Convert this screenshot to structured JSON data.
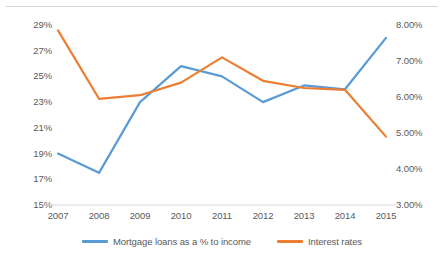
{
  "chart_data": {
    "type": "line",
    "title": "",
    "subtitle": "",
    "xlabel": "",
    "ylabel": "",
    "grid": false,
    "legend_position": "bottom",
    "categories": [
      "2007",
      "2008",
      "2009",
      "2010",
      "2011",
      "2012",
      "2013",
      "2014",
      "2015"
    ],
    "axes": {
      "x": {
        "tick_labels": [
          "2007",
          "2008",
          "2009",
          "2010",
          "2011",
          "2012",
          "2013",
          "2014",
          "2015"
        ]
      },
      "y_left": {
        "label": "",
        "ylim": [
          15,
          29
        ],
        "tick_values": [
          15,
          17,
          19,
          21,
          23,
          25,
          27,
          29
        ],
        "tick_labels": [
          "15%",
          "17%",
          "19%",
          "21%",
          "23%",
          "25%",
          "27%",
          "29%"
        ]
      },
      "y_right": {
        "label": "",
        "ylim": [
          3.0,
          8.0
        ],
        "tick_values": [
          3.0,
          4.0,
          5.0,
          6.0,
          7.0,
          8.0
        ],
        "tick_labels": [
          "3.00%",
          "4.00%",
          "5.00%",
          "6.00%",
          "7.00%",
          "8.00%"
        ]
      }
    },
    "series": [
      {
        "name": "Mortgage loans as a % to income",
        "axis": "y_left",
        "color": "#5B9BD5",
        "values": [
          19.0,
          17.5,
          23.0,
          25.8,
          25.0,
          23.0,
          24.3,
          24.0,
          28.0
        ]
      },
      {
        "name": "Interest rates",
        "axis": "y_right",
        "color": "#ED7D31",
        "values": [
          7.85,
          5.95,
          6.05,
          6.4,
          7.1,
          6.45,
          6.25,
          6.2,
          4.9
        ]
      }
    ]
  },
  "legend": {
    "items": [
      {
        "label": "Mortgage loans as a % to income",
        "color": "#5B9BD5"
      },
      {
        "label": "Interest rates",
        "color": "#ED7D31"
      }
    ]
  }
}
